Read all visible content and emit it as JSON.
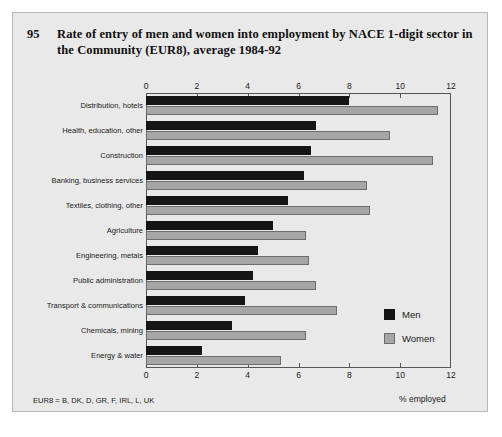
{
  "figure": {
    "number": "95",
    "title": "Rate of entry of men and women into employment by NACE 1-digit sector in the Community (EUR8), average 1984-92",
    "footnote": "EUR8 = B, DK, D, GR, F, IRL, L, UK"
  },
  "legend": {
    "men_label": "Men",
    "women_label": "Women",
    "men_color": "#151515",
    "women_color": "#a6a6a6"
  },
  "chart_data": {
    "type": "bar",
    "orientation": "horizontal",
    "title": "Rate of entry of men and women into employment by NACE 1-digit sector in the Community (EUR8), average 1984-92",
    "xlabel": "% employed",
    "ylabel": "",
    "xlim": [
      0,
      12
    ],
    "xticks": [
      0,
      2,
      4,
      6,
      8,
      10,
      12
    ],
    "xtick_labels": [
      "0",
      "2",
      "4",
      "6",
      "8",
      "10",
      "12"
    ],
    "grid": false,
    "legend_position": "right-inside",
    "categories": [
      "Distribution, hotels",
      "Health, education, other",
      "Construction",
      "Banking, business services",
      "Textiles, clothing, other",
      "Agriculture",
      "Engineering, metals",
      "Public administration",
      "Transport & communications",
      "Chemicals, mining",
      "Energy & water"
    ],
    "series": [
      {
        "name": "Men",
        "color": "#151515",
        "values": [
          8.0,
          6.7,
          6.5,
          6.2,
          5.6,
          5.0,
          4.4,
          4.2,
          3.9,
          3.4,
          2.2
        ]
      },
      {
        "name": "Women",
        "color": "#a6a6a6",
        "values": [
          11.5,
          9.6,
          11.3,
          8.7,
          8.8,
          6.3,
          6.4,
          6.7,
          7.5,
          6.3,
          5.3
        ]
      }
    ]
  }
}
